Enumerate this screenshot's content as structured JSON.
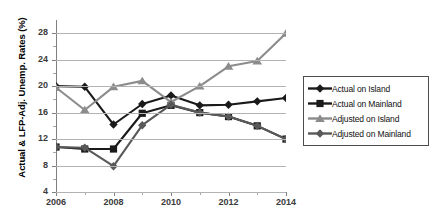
{
  "chart_data": {
    "type": "line",
    "title": "",
    "xlabel": "",
    "ylabel": "Actual & LFP-Adj. Unemp. Rates (%)",
    "x": [
      2006,
      2007,
      2008,
      2009,
      2010,
      2011,
      2012,
      2013,
      2014
    ],
    "xtick_labels": [
      "2006",
      "2008",
      "2010",
      "2012",
      "2014"
    ],
    "xtick_values": [
      2006,
      2008,
      2010,
      2012,
      2014
    ],
    "xminor_values": [
      2007,
      2009,
      2011,
      2013
    ],
    "xlim": [
      2006,
      2014
    ],
    "ytick_labels": [
      "4",
      "8",
      "12",
      "16",
      "20",
      "24",
      "28"
    ],
    "ytick_values": [
      4,
      8,
      12,
      16,
      20,
      24,
      28
    ],
    "yminor_values": [
      6,
      10,
      14,
      18,
      22,
      26
    ],
    "ylim": [
      4,
      30
    ],
    "grid": "horizontal",
    "legend_position": "right",
    "series": [
      {
        "name": "Actual on Island",
        "color": "#1a1a1a",
        "marker": "diamond",
        "values": [
          20.0,
          19.9,
          14.2,
          17.3,
          18.6,
          17.1,
          17.2,
          17.7,
          18.2
        ]
      },
      {
        "name": "Actual on Mainland",
        "color": "#1a1a1a",
        "marker": "square",
        "values": [
          10.8,
          10.5,
          10.5,
          15.9,
          17.1,
          16.0,
          15.4,
          14.0,
          12.0
        ]
      },
      {
        "name": "Adjusted on Island",
        "color": "#8c8c8c",
        "marker": "triangle",
        "values": [
          19.8,
          16.4,
          19.9,
          20.8,
          17.6,
          20.0,
          23.0,
          23.8,
          28.0
        ]
      },
      {
        "name": "Adjusted on Mainland",
        "color": "#595959",
        "marker": "diamond",
        "values": [
          10.8,
          10.7,
          7.9,
          14.1,
          17.2,
          16.0,
          15.4,
          14.0,
          12.0
        ]
      }
    ]
  },
  "legend": {
    "items": [
      {
        "label": "Actual on Island"
      },
      {
        "label": "Actual on Mainland"
      },
      {
        "label": "Adjusted on Island"
      },
      {
        "label": "Adjusted on Mainland"
      }
    ]
  }
}
